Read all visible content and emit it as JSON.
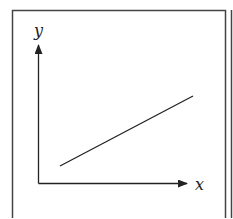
{
  "diagram": {
    "type": "linear-graph-sketch",
    "axes": {
      "x_label": "x",
      "y_label": "y"
    },
    "line": {
      "description": "straight line with positive slope, not passing through origin",
      "slope": "positive",
      "y_intercept": "positive"
    },
    "colors": {
      "stroke": "#222222",
      "frame": "#444444",
      "background": "#ffffff"
    }
  }
}
